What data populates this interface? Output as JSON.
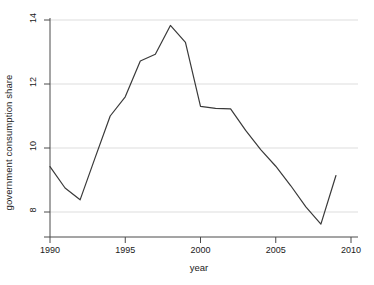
{
  "chart_data": {
    "type": "line",
    "title": "",
    "xlabel": "year",
    "ylabel": "government consumption share",
    "xlim": [
      1989.3,
      2010.7
    ],
    "ylim": [
      7.45,
      14.15
    ],
    "xticks": [
      1990,
      1995,
      2000,
      2005,
      2010
    ],
    "xtick_labels": [
      "1990",
      "1995",
      "2000",
      "2005",
      "2010"
    ],
    "yticks": [
      8,
      10,
      12,
      14
    ],
    "ytick_labels": [
      "8",
      "10",
      "12",
      "14"
    ],
    "grid": "horizontal",
    "grid_color": "#d9d9d9",
    "line_color": "#3a3a3a",
    "line_width": 1.2,
    "legend": null,
    "x": [
      1990,
      1991,
      1992,
      1993,
      1994,
      1995,
      1996,
      1997,
      1998,
      1999,
      2000,
      2001,
      2002,
      2003,
      2004,
      2005,
      2006,
      2007,
      2008,
      2009
    ],
    "values": [
      9.42,
      8.75,
      8.38,
      9.7,
      11.0,
      11.6,
      12.72,
      12.93,
      13.83,
      13.3,
      11.3,
      11.24,
      11.22,
      10.55,
      9.95,
      9.43,
      8.82,
      8.16,
      7.62,
      9.14
    ],
    "series": [
      {
        "name": "government consumption share",
        "values": [
          9.42,
          8.75,
          8.38,
          9.7,
          11.0,
          11.6,
          12.72,
          12.93,
          13.83,
          13.3,
          11.3,
          11.24,
          11.22,
          10.55,
          9.95,
          9.43,
          8.82,
          8.16,
          7.62,
          9.14
        ]
      }
    ],
    "annotations": []
  },
  "axes": {
    "y_title": "government consumption share",
    "x_title": "year"
  }
}
